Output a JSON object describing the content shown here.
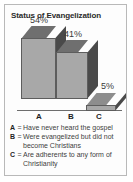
{
  "chart_data": {
    "type": "bar",
    "title": "Status of Evangelization",
    "categories": [
      "A",
      "B",
      "C"
    ],
    "values": [
      54,
      41,
      5
    ],
    "value_labels": [
      "54%",
      "41%",
      "5%"
    ],
    "xlabel": "",
    "ylabel": "",
    "ylim": [
      0,
      60
    ],
    "grid": false,
    "legend_position": "below",
    "legend": [
      {
        "key": "A",
        "separator": "=",
        "text": "Have never heard the gospel"
      },
      {
        "key": "B",
        "separator": "=",
        "text": "Were evangelized but did not become Christians"
      },
      {
        "key": "C",
        "separator": "=",
        "text": "Are adherents to any form of Christianity"
      }
    ],
    "colors": {
      "bar_front": "#a8a8a8",
      "bar_top": "#6f6f6f",
      "bar_side": "#4a4a4a",
      "border": "#b9b9b9",
      "background": "#fdfdfd",
      "text": "#3d3d3d"
    }
  }
}
